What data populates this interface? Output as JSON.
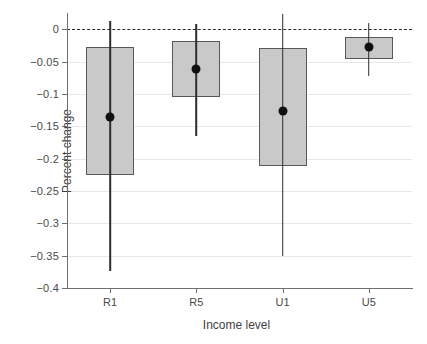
{
  "chart_data": {
    "type": "bar",
    "title": "",
    "subtitle": "",
    "xlabel": "Income level",
    "ylabel": "Percent change",
    "categories": [
      "R1",
      "R5",
      "U1",
      "U5"
    ],
    "ylim": [
      -0.4,
      0.025
    ],
    "yticks": [
      0,
      -0.05,
      -0.1,
      -0.15,
      -0.2,
      -0.25,
      -0.3,
      -0.35,
      -0.4
    ],
    "ytick_labels": [
      "0",
      "−0.05",
      "−0.1",
      "−0.15",
      "−0.2",
      "−0.25",
      "−0.3",
      "−0.35",
      "−0.4"
    ],
    "grid": true,
    "legend": "none",
    "reference_line": {
      "value": 0,
      "style": "dashed",
      "color": "#2b2b2b"
    },
    "values": [
      -0.136,
      -0.061,
      -0.127,
      -0.028
    ],
    "series": [
      {
        "name": "Percent change",
        "point_estimates": [
          -0.136,
          -0.061,
          -0.127,
          -0.028
        ],
        "box_upper": [
          -0.027,
          -0.018,
          -0.029,
          -0.012
        ],
        "box_lower": [
          -0.225,
          -0.105,
          -0.211,
          -0.046
        ],
        "whisker_upper": [
          0.013,
          0.008,
          0.023,
          0.009
        ],
        "whisker_lower": [
          -0.373,
          -0.165,
          -0.351,
          -0.072
        ]
      }
    ],
    "points": [
      {
        "category": "R1",
        "estimate": -0.136,
        "box_upper": -0.027,
        "box_lower": -0.225,
        "whisker_upper": 0.013,
        "whisker_lower": -0.373
      },
      {
        "category": "R5",
        "estimate": -0.061,
        "box_upper": -0.018,
        "box_lower": -0.105,
        "whisker_upper": 0.008,
        "whisker_lower": -0.165
      },
      {
        "category": "U1",
        "estimate": -0.127,
        "box_upper": -0.029,
        "box_lower": -0.211,
        "whisker_upper": 0.023,
        "whisker_lower": -0.351
      },
      {
        "category": "U5",
        "estimate": -0.028,
        "box_upper": -0.012,
        "box_lower": -0.046,
        "whisker_upper": 0.009,
        "whisker_lower": -0.072
      }
    ],
    "colors": {
      "bar_fill": "#c9c9c9",
      "bar_edge": "#585858",
      "point": "#101010",
      "whisker": "#2e2e2e",
      "grid": "#e8e8e8",
      "axis": "#6f6f6f",
      "background": "#ffffff"
    }
  }
}
